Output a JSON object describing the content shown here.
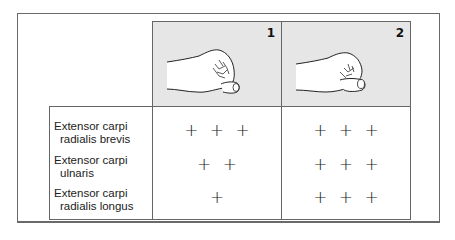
{
  "figure": {
    "columns": [
      {
        "number": "1",
        "image": "hand-fist-thumb-under-fingers"
      },
      {
        "number": "2",
        "image": "hand-fist-thumb-over-fingers"
      }
    ],
    "rows": [
      {
        "muscle_line1": "Extensor carpi",
        "muscle_line2": "radialis brevis",
        "col1": "+ + +",
        "col2": "+ + +"
      },
      {
        "muscle_line1": "Extensor carpi",
        "muscle_line2": "ulnaris",
        "col1": "+ +",
        "col2": "+ + +"
      },
      {
        "muscle_line1": "Extensor carpi",
        "muscle_line2": "radialis longus",
        "col1": "+",
        "col2": "+ + +"
      }
    ],
    "colors": {
      "image_bg": "#e6e6e6",
      "border": "#666666"
    }
  }
}
